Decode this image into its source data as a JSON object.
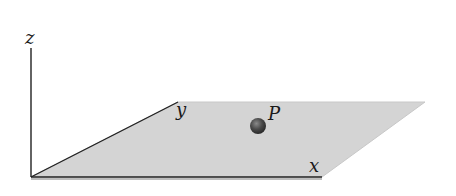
{
  "diagram": {
    "axes": {
      "z_label": "z",
      "y_label": "y",
      "x_label": "x"
    },
    "point": {
      "label": "P"
    },
    "colors": {
      "plane_fill": "#d4d4d4",
      "plane_edge": "#c2c2c2",
      "axis": "#222222",
      "point_fill": "#4a4a4a",
      "point_highlight": "#8a8a8a",
      "background": "#ffffff"
    }
  }
}
